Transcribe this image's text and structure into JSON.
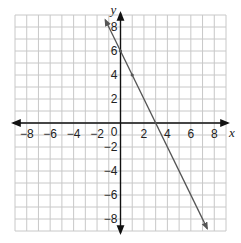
{
  "chart_data": {
    "type": "line",
    "title": "",
    "xlabel": "x",
    "ylabel": "y",
    "xlim": [
      -9,
      9
    ],
    "ylim": [
      -9,
      9
    ],
    "grid": true,
    "x_ticks": [
      -8,
      -6,
      -4,
      -2,
      2,
      4,
      6,
      8
    ],
    "y_ticks": [
      -8,
      -6,
      -4,
      -2,
      2,
      4,
      6,
      8
    ],
    "x_tick_labels": [
      "−8",
      "−6",
      "−4",
      "−2",
      "2",
      "4",
      "6",
      "8"
    ],
    "y_tick_labels": [
      "−8",
      "−6",
      "−4",
      "−2",
      "2",
      "4",
      "6",
      "8"
    ],
    "origin_label": "0",
    "series": [
      {
        "name": "line",
        "equation": "y = -2x + 6",
        "slope": -2,
        "intercept": 6,
        "x": [
          -1.3,
          0,
          1,
          3,
          7.4
        ],
        "y": [
          8.6,
          6,
          4,
          0,
          -8.8
        ],
        "marked_points": [
          [
            0,
            6
          ],
          [
            1,
            4
          ]
        ],
        "arrows_both_ends": true,
        "color": "#555555"
      }
    ],
    "colors": {
      "grid": "#c8c8c8",
      "axes": "#111111",
      "line": "#555555"
    }
  }
}
